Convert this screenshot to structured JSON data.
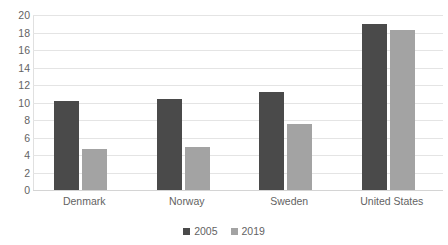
{
  "chart_data": {
    "type": "bar",
    "title": "",
    "xlabel": "",
    "ylabel": "",
    "categories": [
      "Denmark",
      "Norway",
      "Sweden",
      "United States"
    ],
    "series": [
      {
        "name": "2005",
        "color": "#4a4a4a",
        "values": [
          10.2,
          10.4,
          11.2,
          19.0
        ]
      },
      {
        "name": "2019",
        "color": "#a3a3a3",
        "values": [
          4.7,
          4.9,
          7.6,
          18.3
        ]
      }
    ],
    "ylim": [
      0,
      20
    ],
    "ytick_step": 2,
    "ytick_labels": [
      "20",
      "18",
      "16",
      "14",
      "12",
      "10",
      "8",
      "6",
      "4",
      "2",
      "0"
    ],
    "grid": true,
    "legend_position": "bottom"
  },
  "axes": {
    "y_ticks": [
      20,
      18,
      16,
      14,
      12,
      10,
      8,
      6,
      4,
      2,
      0
    ]
  },
  "legend": {
    "items": [
      {
        "label": "2005",
        "color": "#4a4a4a"
      },
      {
        "label": "2019",
        "color": "#a3a3a3"
      }
    ]
  },
  "colors": {
    "series_2005": "#4a4a4a",
    "series_2019": "#a3a3a3",
    "gridline": "#e4e4e4",
    "text": "#636363",
    "background": "#ffffff"
  }
}
